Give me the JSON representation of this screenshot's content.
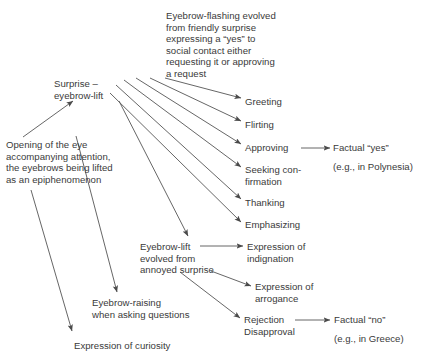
{
  "diagram": {
    "type": "flow-diagram",
    "background_color": "#ffffff",
    "text_color": "#3a3a3a",
    "line_color": "#555555",
    "nodes": [
      {
        "id": "eyebrow_flashing",
        "label": "Eyebrow-flashing evolved\nfrom friendly surprise\nexpressing a “yes” to\nsocial contact either\nrequesting it or approving\na request",
        "x": 166,
        "y": 10,
        "width": 180
      },
      {
        "id": "surprise_eyebrow_lift",
        "label": "Surprise –\neyebrow-lift",
        "x": 54,
        "y": 78,
        "width": 110
      },
      {
        "id": "opening_of_the_eye",
        "label": "Opening of the eye\naccompanying attention,\nthe eyebrows being lifted\nas an epiphenomenon",
        "x": 6,
        "y": 139,
        "width": 160
      },
      {
        "id": "greeting",
        "label": "Greeting",
        "x": 245,
        "y": 96,
        "width": 80
      },
      {
        "id": "flirting",
        "label": "Flirting",
        "x": 245,
        "y": 119,
        "width": 80
      },
      {
        "id": "approving",
        "label": "Approving",
        "x": 245,
        "y": 142,
        "width": 80
      },
      {
        "id": "seeking_confirmation",
        "label": "Seeking con-\nfirmation",
        "x": 245,
        "y": 164,
        "width": 80
      },
      {
        "id": "thanking",
        "label": "Thanking",
        "x": 245,
        "y": 197,
        "width": 80
      },
      {
        "id": "emphasizing",
        "label": "Emphasizing",
        "x": 245,
        "y": 219,
        "width": 85
      },
      {
        "id": "factual_yes",
        "label": "Factual “yes”",
        "x": 333,
        "y": 142,
        "width": 95
      },
      {
        "id": "factual_yes_note",
        "label": "(e.g., in Polynesia)",
        "x": 333,
        "y": 161,
        "width": 100
      },
      {
        "id": "eyebrow_lift_annoyed",
        "label": "Eyebrow-lift\nevolved from\nannoyed surprise",
        "x": 140,
        "y": 241,
        "width": 100
      },
      {
        "id": "expression_of_indignation",
        "label": "Expression of\nindignation",
        "x": 247,
        "y": 241,
        "width": 90
      },
      {
        "id": "expression_of_arrogance",
        "label": "Expression of\narrogance",
        "x": 255,
        "y": 281,
        "width": 90
      },
      {
        "id": "rejection_disapproval",
        "label": "Rejection\nDisapproval",
        "x": 244,
        "y": 314,
        "width": 75
      },
      {
        "id": "factual_no",
        "label": "Factual “no”",
        "x": 334,
        "y": 314,
        "width": 90
      },
      {
        "id": "factual_no_note",
        "label": "(e.g., in Greece)",
        "x": 334,
        "y": 333,
        "width": 95
      },
      {
        "id": "eyebrow_raising_questions",
        "label": "Eyebrow-raising\nwhen asking questions",
        "x": 92,
        "y": 297,
        "width": 140
      },
      {
        "id": "expression_of_curiosity",
        "label": "Expression of curiosity",
        "x": 74,
        "y": 340,
        "width": 140
      }
    ],
    "edges": [
      {
        "from": "opening_of_the_eye",
        "to": "surprise_eyebrow_lift"
      },
      {
        "from": "surprise_eyebrow_lift",
        "to": "greeting"
      },
      {
        "from": "surprise_eyebrow_lift",
        "to": "flirting"
      },
      {
        "from": "surprise_eyebrow_lift",
        "to": "approving"
      },
      {
        "from": "surprise_eyebrow_lift",
        "to": "seeking_confirmation"
      },
      {
        "from": "surprise_eyebrow_lift",
        "to": "thanking"
      },
      {
        "from": "surprise_eyebrow_lift",
        "to": "emphasizing"
      },
      {
        "from": "approving",
        "to": "factual_yes"
      },
      {
        "from": "surprise_eyebrow_lift",
        "to": "eyebrow_lift_annoyed"
      },
      {
        "from": "surprise_eyebrow_lift",
        "to": "eyebrow_raising_questions"
      },
      {
        "from": "surprise_eyebrow_lift",
        "to": "expression_of_curiosity"
      },
      {
        "from": "eyebrow_lift_annoyed",
        "to": "expression_of_indignation"
      },
      {
        "from": "eyebrow_lift_annoyed",
        "to": "expression_of_arrogance"
      },
      {
        "from": "eyebrow_lift_annoyed",
        "to": "rejection_disapproval"
      },
      {
        "from": "rejection_disapproval",
        "to": "factual_no"
      }
    ]
  }
}
